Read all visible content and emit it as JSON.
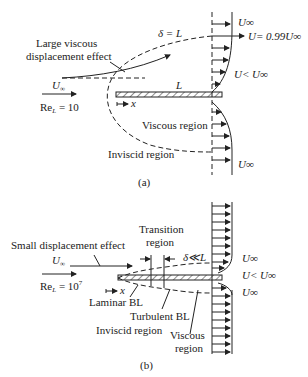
{
  "figure_a": {
    "caption": "(a)",
    "freestream_label": "U",
    "freestream_sub": "∞",
    "reynolds_label": "Re",
    "reynolds_sub": "L",
    "reynolds_value": " = 10",
    "delta_label": "δ = L",
    "plate_length_label": "L",
    "x_label": "x",
    "displacement_label_line1": "Large viscous",
    "displacement_label_line2": "displacement effect",
    "viscous_region": "Viscous region",
    "inviscid_region": "Inviscid region",
    "profile_labels": {
      "top": "U∞",
      "edge": "U= 0.99U∞",
      "inner": "U< U∞",
      "bottom": "U∞"
    }
  },
  "figure_b": {
    "caption": "(b)",
    "freestream_label": "U",
    "freestream_sub": "∞",
    "reynolds_label": "Re",
    "reynolds_sub": "L",
    "reynolds_value": " = 10",
    "reynolds_exp": "7",
    "delta_label": "δ≪L",
    "x_label": "x",
    "displacement_label": "Small displacement effect",
    "transition_line1": "Transition",
    "transition_line2": "region",
    "laminar_bl": "Laminar BL",
    "turbulent_bl": "Turbulent BL",
    "inviscid_region": "Inviscid region",
    "viscous_line1": "Viscous",
    "viscous_line2": "region",
    "profile_labels": {
      "top": "U∞",
      "inner": "U< U∞",
      "bottom": "U∞"
    }
  }
}
